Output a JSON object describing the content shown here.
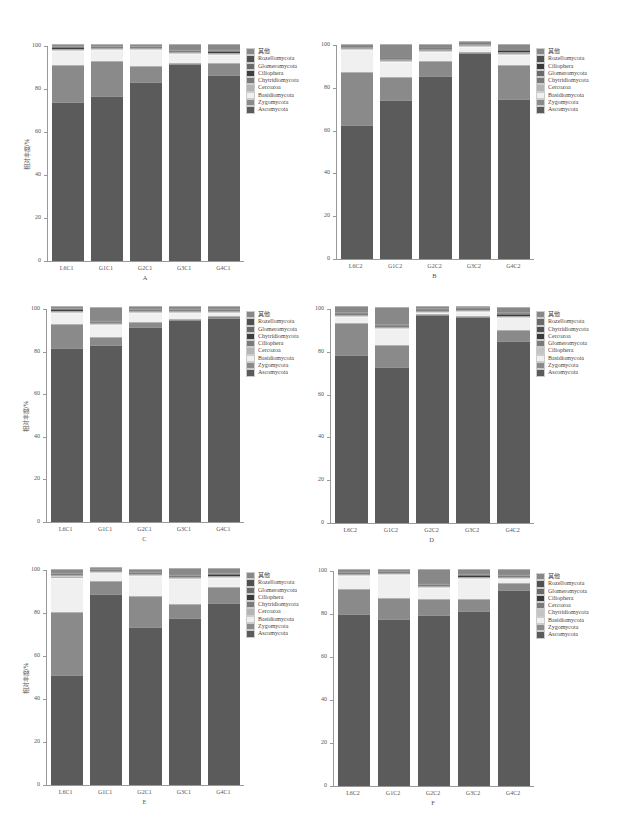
{
  "figure": {
    "ylabel": "相对丰度/%",
    "yticks": [
      "0",
      "20",
      "40",
      "60",
      "80",
      "100"
    ],
    "caption": ""
  },
  "colors": {
    "Ascomycota": "#5b5b5b",
    "Zygomycota": "#8a8a8a",
    "Basidiomycota": "#f0f0f0",
    "Cercozoa": "#b5b5b5",
    "Chytridiomycota": "#7a7a7a",
    "Ciliophera": "#c4c4c4",
    "Glomeromycota": "#6a6a6a",
    "Rozellomycota": "#505050",
    "其他": "#888888",
    "Chytridiomycota_dark": "#3e3e3e",
    "Ciliophera_dark": "#3a3a3a"
  },
  "chart_data": [
    {
      "id": "A",
      "type": "bar",
      "stacked": true,
      "title": "A",
      "xlabel": "",
      "ylabel": "相对丰度/%",
      "ylim": [
        0,
        100
      ],
      "categories": [
        "L6C1",
        "G1C1",
        "G2C1",
        "G3C1",
        "G4C1"
      ],
      "legend": [
        "其他",
        "Rozellomycota",
        "Glomeromycota",
        "Ciliophera",
        "Chytridiomycota",
        "Cercozoa",
        "Basidiomycota",
        "Zygomycota",
        "Ascomycota"
      ],
      "series": [
        {
          "name": "Ascomycota",
          "color": "#5b5b5b",
          "values": [
            74,
            77,
            83.5,
            92,
            87
          ]
        },
        {
          "name": "Zygomycota",
          "color": "#8a8a8a",
          "values": [
            17,
            16.5,
            7.5,
            0.5,
            5.5
          ]
        },
        {
          "name": "Basidiomycota",
          "color": "#f0f0f0",
          "values": [
            6.5,
            5,
            7.5,
            4.5,
            4
          ]
        },
        {
          "name": "Cercozoa",
          "color": "#b5b5b5",
          "values": [
            0.2,
            0.2,
            0.2,
            0.2,
            0.2
          ]
        },
        {
          "name": "Chytridiomycota",
          "color": "#7a7a7a",
          "values": [
            0.3,
            0.3,
            0.3,
            0.3,
            0.3
          ]
        },
        {
          "name": "Ciliophera",
          "color": "#3e3e3e",
          "values": [
            1,
            0.5,
            0.5,
            0.3,
            0.8
          ]
        },
        {
          "name": "Glomeromycota",
          "color": "#6a6a6a",
          "values": [
            0.3,
            0.3,
            0.3,
            0.2,
            0.2
          ]
        },
        {
          "name": "Rozellomycota",
          "color": "#505050",
          "values": [
            0.2,
            0.2,
            0.2,
            0.2,
            0.2
          ]
        },
        {
          "name": "其他",
          "color": "#888888",
          "values": [
            0.5,
            0.5,
            0.5,
            2.3,
            2.3
          ]
        }
      ]
    },
    {
      "id": "B",
      "type": "bar",
      "stacked": true,
      "title": "B",
      "xlabel": "",
      "ylabel": "",
      "ylim": [
        0,
        100
      ],
      "categories": [
        "L6C2",
        "G1C2",
        "G2C2",
        "G3C2",
        "G4C2"
      ],
      "legend": [
        "其他",
        "Rozellomycota",
        "Ciliophera",
        "Glomeromycota",
        "Chytridiomycota",
        "Cercozoa",
        "Basidiomycota",
        "Zygomycota",
        "Ascomycota"
      ],
      "series": [
        {
          "name": "Ascomycota",
          "color": "#5b5b5b",
          "values": [
            62.5,
            74.5,
            86,
            96.5,
            75
          ]
        },
        {
          "name": "Zygomycota",
          "color": "#8a8a8a",
          "values": [
            25,
            10.5,
            7,
            0.3,
            15.5
          ]
        },
        {
          "name": "Basidiomycota",
          "color": "#f0f0f0",
          "values": [
            10,
            7,
            4,
            2,
            5
          ]
        },
        {
          "name": "Cercozoa",
          "color": "#b5b5b5",
          "values": [
            0.2,
            0.2,
            0.2,
            0.2,
            0.2
          ]
        },
        {
          "name": "Chytridiomycota",
          "color": "#7a7a7a",
          "values": [
            0.3,
            0.3,
            0.3,
            0.2,
            0.3
          ]
        },
        {
          "name": "Glomeromycota",
          "color": "#6a6a6a",
          "values": [
            0.5,
            0.5,
            0.3,
            0.2,
            0.3
          ]
        },
        {
          "name": "Ciliophera",
          "color": "#3a3a3a",
          "values": [
            0.5,
            0.5,
            0.5,
            0.2,
            0.8
          ]
        },
        {
          "name": "Rozellomycota",
          "color": "#505050",
          "values": [
            0.5,
            0.5,
            0.5,
            0.2,
            0.4
          ]
        },
        {
          "name": "其他",
          "color": "#888888",
          "values": [
            0.5,
            6,
            1.7,
            0.2,
            2.5
          ]
        }
      ]
    },
    {
      "id": "C",
      "type": "bar",
      "stacked": true,
      "title": "C",
      "xlabel": "",
      "ylabel": "相对丰度/%",
      "ylim": [
        0,
        100
      ],
      "categories": [
        "L6C1",
        "G1C1",
        "G2C1",
        "G3C1",
        "G4C1"
      ],
      "legend": [
        "其他",
        "Rozellomycota",
        "Glomeromycota",
        "Chytridiomycota",
        "Ciliophera",
        "Cercozoa",
        "Basidiomycota",
        "Zygomycota",
        "Ascomycota"
      ],
      "series": [
        {
          "name": "Ascomycota",
          "color": "#5b5b5b",
          "values": [
            81.5,
            83,
            91.5,
            95,
            96
          ]
        },
        {
          "name": "Zygomycota",
          "color": "#8a8a8a",
          "values": [
            11.5,
            4,
            2.5,
            0.5,
            0.5
          ]
        },
        {
          "name": "Basidiomycota",
          "color": "#f0f0f0",
          "values": [
            5,
            5.5,
            4,
            2.5,
            1.5
          ]
        },
        {
          "name": "Cercozoa",
          "color": "#b5b5b5",
          "values": [
            0.2,
            0.2,
            0.2,
            0.2,
            0.2
          ]
        },
        {
          "name": "Ciliophera",
          "color": "#7a7a7a",
          "values": [
            0.2,
            0.2,
            0.2,
            0.2,
            0.2
          ]
        },
        {
          "name": "Chytridiomycota",
          "color": "#3e3e3e",
          "values": [
            1,
            0.5,
            0.3,
            0.3,
            0.3
          ]
        },
        {
          "name": "Glomeromycota",
          "color": "#6a6a6a",
          "values": [
            0.2,
            0.2,
            0.2,
            0.2,
            0.2
          ]
        },
        {
          "name": "Rozellomycota",
          "color": "#505050",
          "values": [
            0.2,
            0.2,
            0.2,
            0.2,
            0.2
          ]
        },
        {
          "name": "其他",
          "color": "#888888",
          "values": [
            0.2,
            6.2,
            0.9,
            0.9,
            0.9
          ]
        }
      ]
    },
    {
      "id": "D",
      "type": "bar",
      "stacked": true,
      "title": "D",
      "xlabel": "",
      "ylabel": "",
      "ylim": [
        0,
        100
      ],
      "categories": [
        "L6C2",
        "G1C2",
        "G2C2",
        "G3C2",
        "G4C2"
      ],
      "legend": [
        "其他",
        "Rozellomycota",
        "Chytridiomycota",
        "Cercozoa",
        "Glomeromycota",
        "Ciliophera",
        "Basidiomycota",
        "Zygomycota",
        "Ascomycota"
      ],
      "series": [
        {
          "name": "Ascomycota",
          "color": "#5b5b5b",
          "values": [
            78.5,
            73,
            97,
            96.5,
            85
          ]
        },
        {
          "name": "Zygomycota",
          "color": "#8a8a8a",
          "values": [
            15,
            10,
            0.3,
            0.3,
            5
          ]
        },
        {
          "name": "Basidiomycota",
          "color": "#f0f0f0",
          "values": [
            3,
            7.5,
            0.5,
            1.5,
            6
          ]
        },
        {
          "name": "Ciliophera",
          "color": "#c4c4c4",
          "values": [
            0.2,
            0.2,
            0.2,
            0.2,
            0.2
          ]
        },
        {
          "name": "Glomeromycota",
          "color": "#7a7a7a",
          "values": [
            0.2,
            0.2,
            0.2,
            0.2,
            0.2
          ]
        },
        {
          "name": "Cercozoa",
          "color": "#3a3a3a",
          "values": [
            0.2,
            0.5,
            0.8,
            0.5,
            0.8
          ]
        },
        {
          "name": "Chytridiomycota",
          "color": "#505050",
          "values": [
            0.2,
            0.2,
            0.2,
            0.2,
            0.2
          ]
        },
        {
          "name": "Rozellomycota",
          "color": "#6a6a6a",
          "values": [
            0.2,
            0.2,
            0.2,
            0.2,
            0.2
          ]
        },
        {
          "name": "其他",
          "color": "#888888",
          "values": [
            2.5,
            8.2,
            0.6,
            0.4,
            2.2
          ]
        }
      ]
    },
    {
      "id": "E",
      "type": "bar",
      "stacked": true,
      "title": "E",
      "xlabel": "",
      "ylabel": "相对丰度/%",
      "ylim": [
        0,
        100
      ],
      "categories": [
        "L6C1",
        "G1C1",
        "G2C1",
        "G3C1",
        "G4C1"
      ],
      "legend": [
        "其他",
        "Rozellomycota",
        "Glomeromycota",
        "Ciliophera",
        "Chytridiomycota",
        "Cercozoa",
        "Basidiomycota",
        "Zygomycota",
        "Ascomycota"
      ],
      "series": [
        {
          "name": "Ascomycota",
          "color": "#5b5b5b",
          "values": [
            51,
            89,
            73.5,
            77.5,
            84.5
          ]
        },
        {
          "name": "Zygomycota",
          "color": "#8a8a8a",
          "values": [
            29.5,
            6,
            14.5,
            6.5,
            7.5
          ]
        },
        {
          "name": "Basidiomycota",
          "color": "#f0f0f0",
          "values": [
            16,
            3.5,
            9,
            12,
            4.5
          ]
        },
        {
          "name": "Cercozoa",
          "color": "#b5b5b5",
          "values": [
            0.5,
            0.3,
            0.5,
            0.3,
            0.3
          ]
        },
        {
          "name": "Chytridiomycota",
          "color": "#7a7a7a",
          "values": [
            0.5,
            0.2,
            0.5,
            0.3,
            0.3
          ]
        },
        {
          "name": "Ciliophera",
          "color": "#3a3a3a",
          "values": [
            0.5,
            0.5,
            0.5,
            0.5,
            0.5
          ]
        },
        {
          "name": "Glomeromycota",
          "color": "#6a6a6a",
          "values": [
            0.3,
            0.2,
            0.3,
            0.2,
            0.2
          ]
        },
        {
          "name": "Rozellomycota",
          "color": "#505050",
          "values": [
            0.2,
            0.1,
            0.2,
            0.2,
            0.2
          ]
        },
        {
          "name": "其他",
          "color": "#888888",
          "values": [
            1.5,
            0.2,
            1,
            2.5,
            2
          ]
        }
      ]
    },
    {
      "id": "F",
      "type": "bar",
      "stacked": true,
      "title": "F",
      "xlabel": "",
      "ylabel": "",
      "ylim": [
        0,
        100
      ],
      "categories": [
        "L6C2",
        "G1C2",
        "G2C2",
        "G3C2",
        "G4C2"
      ],
      "legend": [
        "其他",
        "Rozellomycota",
        "Glomeromycota",
        "Ciliophera",
        "Cercozoa",
        "Chytridiomycota",
        "Basidiomycota",
        "Zygomycota",
        "Ascomycota"
      ],
      "series": [
        {
          "name": "Ascomycota",
          "color": "#5b5b5b",
          "values": [
            80,
            77.5,
            79.5,
            81.5,
            91
          ]
        },
        {
          "name": "Zygomycota",
          "color": "#8a8a8a",
          "values": [
            11.5,
            10,
            7.5,
            5.5,
            3.5
          ]
        },
        {
          "name": "Basidiomycota",
          "color": "#f0f0f0",
          "values": [
            6,
            10.5,
            5,
            9.5,
            2
          ]
        },
        {
          "name": "Chytridiomycota",
          "color": "#c4c4c4",
          "values": [
            0.3,
            0.3,
            0.3,
            0.3,
            0.3
          ]
        },
        {
          "name": "Cercozoa",
          "color": "#7a7a7a",
          "values": [
            0.3,
            0.3,
            0.3,
            0.3,
            0.3
          ]
        },
        {
          "name": "Ciliophera",
          "color": "#3a3a3a",
          "values": [
            0.2,
            0.5,
            0.5,
            0.6,
            0.2
          ]
        },
        {
          "name": "Glomeromycota",
          "color": "#6a6a6a",
          "values": [
            0.2,
            0.2,
            0.2,
            0.2,
            0.2
          ]
        },
        {
          "name": "Rozellomycota",
          "color": "#505050",
          "values": [
            0.2,
            0.2,
            0.2,
            0.2,
            0.2
          ]
        },
        {
          "name": "其他",
          "color": "#888888",
          "values": [
            1.3,
            0.5,
            6.5,
            1.9,
            2.3
          ]
        }
      ]
    }
  ]
}
